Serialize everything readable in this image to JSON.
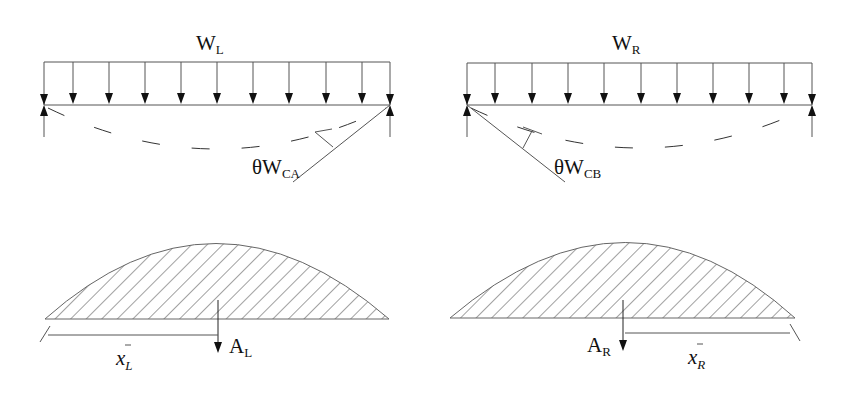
{
  "diagram": {
    "left_span": {
      "load_label": "W",
      "load_subscript": "L",
      "rotation_label": "θW",
      "rotation_subscript": "CA",
      "area_label": "A",
      "area_subscript": "L",
      "centroid_label": "x",
      "centroid_subscript": "L",
      "load_arrow_count": 11
    },
    "right_span": {
      "load_label": "W",
      "load_subscript": "R",
      "rotation_label": "θW",
      "rotation_subscript": "CB",
      "area_label": "A",
      "area_subscript": "R",
      "centroid_label": "x",
      "centroid_subscript": "R",
      "load_arrow_count": 11
    },
    "colors": {
      "ink": "#111111",
      "line": "#555555",
      "background": "#ffffff"
    }
  }
}
